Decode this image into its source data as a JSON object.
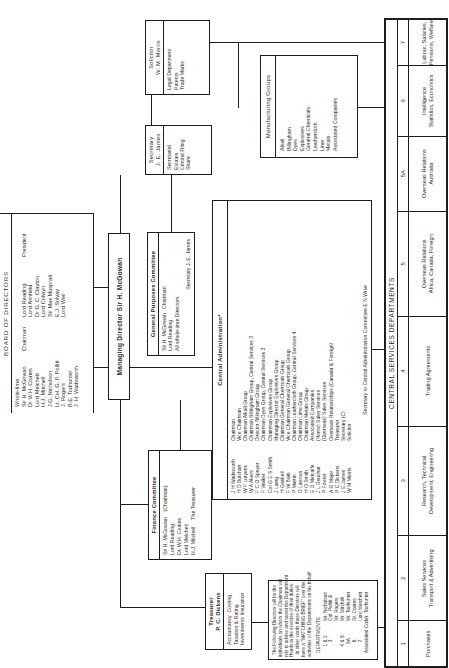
{
  "board": {
    "title": "BOARD OF DIRECTORS",
    "wholetime_label": "Whole-time",
    "wholetime": [
      {
        "name": "Sir H. McGowan",
        "role": "Chairman"
      },
      {
        "name": "Dr W.H. Coates",
        "role": ""
      },
      {
        "name": "Lord Melchett",
        "role": ""
      },
      {
        "name": "H.J. Mitchell",
        "role": ""
      },
      {
        "name": "J.G. Nicholson",
        "role": ""
      },
      {
        "name": "Lt. Col. G. P. Pollitt",
        "role": ""
      },
      {
        "name": "J. Rogers",
        "role": ""
      },
      {
        "name": "B.E. Todhunter",
        "role": ""
      },
      {
        "name": "J. H. Wadsworth",
        "role": ""
      }
    ],
    "others": [
      {
        "name": "Lord Reading",
        "role": "President"
      },
      {
        "name": "Lord Ashfield",
        "role": ""
      },
      {
        "name": "Dr G. C. Clayton",
        "role": ""
      },
      {
        "name": "Lord Colwyn",
        "role": ""
      },
      {
        "name": "Sir Max Muspratt",
        "role": ""
      },
      {
        "name": "E.J. Solvay",
        "role": ""
      },
      {
        "name": "Lord Weir",
        "role": ""
      }
    ],
    "wholetime_text": "Sir H. McGowan\nDr W.H. Coates\nLord Melchett\nH.J. Mitchell\nJ.G. Nicholson\nLt. Col. G. P. Pollitt\nJ. Rogers\nB.E. Todhunter\nJ. H. Wadsworth",
    "wholetime_roles": "Chairman",
    "others_text": "Lord Reading\nLord Ashfield\nDr G. C. Clayton\nLord Colwyn\nSir Max Muspratt\nE.J. Solvay\nLord Weir",
    "others_roles": "President"
  },
  "managing_director": {
    "title": "Managing Director Sir H. McGowan"
  },
  "general_purposes": {
    "title": "General Purposes Committee",
    "members_text": "Sir H. McGowan   Chairman\nLord Reading\nAll whole-time Directors",
    "secretary": "Secretary  J. E. James"
  },
  "finance_committee": {
    "title": "Finance Committee",
    "members_text": "Sir H. McGowan    (Chairman)\nLord Reading\nDr. W.H. Coates\nLord Melchett\nH.J. Mitchell     The Treasurer"
  },
  "treasurer": {
    "title_line1": "Treasurer",
    "title_line2": "P. C. Dickens",
    "duties_text": "Accountancy  Costing\nTaxation & Rating\nInvestments Insurance"
  },
  "secretary": {
    "title_line1": "Secretary",
    "title_line2": "J. E. James",
    "duties_text": "Secretarial\nEstates\nCentral Filing\nShare"
  },
  "solicitor": {
    "title_line1": "Solicitor",
    "title_line2": "W. M. Morris",
    "duties_text": "Legal Department\nPatents\nTrade Marks"
  },
  "manufacturing_groups": {
    "title": "Manufacturing Groups",
    "groups_text": "Alkali\nBillingham\nDyes\nExplosives\nGeneral Chemicals\nLeathercloth\nLime\nMetals\nAssociated Companies"
  },
  "central_admin": {
    "title": "Central Administration*",
    "names_text": "J H Wadsworth\nH D Butchart\nW F Lutyens\nW A Akers\nF C O Speyer\nF Walker\nCol G E S Smith\nJ Laing\nH Gaskell\nF W Bain\nP Martin\nD Lawson\nH O Smith\nE D Metcalfe\nJ L Deuchar\nP Fowler\nA G Major\nP C Dickens\nJ E James\nW M Morris",
    "roles_text": "Chairman\nVice Chairman\nChairman Alkali Group\nChairman Billingham Group, Central Services 3\nDirector Billingham Group\nChairman Dyes Group, Central Services 3\nChairman Explosives Group\nManaging Director Explosives Group\nChairman General Chemicals Group\nVice Chairman General Chemicals Group\nChairman Leathercloth Group, Central Services 4\nChairman Lime Group\nChairman Metals Group\nAssociated Companies\n(Home) Sales Services\n(Overseas) Sales Services\nOverseas Relationships (Canada & Foreign)\nTreasurer\nSecretary (C)\nSolicitor",
    "footer": "Secretary to Central Administration Committee   E N Wise"
  },
  "watching_brief": {
    "note_text": "The Following Directors will be the\nindividuals on whom the Chairman will\nrely to advise and assist the Department\nHeads in the exercise of their duties.\nIn other words these Directors will\nhave a \"WATCHING BRIEF\" over the\nactivities of the Departments on his behalf",
    "departments_label": "DEPARTMENTS",
    "dept_numbers_text": "1 & 2\n3\n\n4 & 5\n5A\n6\n7\nAssociated Cos.",
    "directors_text": "Mr. Nicholson\nCol. Pollitt &\nMr. Rogers\nMr. Mitchell\nMr. Todhunter\nDr. Coates\nLord Melchett\nMr. Todhunter"
  },
  "central_services": {
    "title": "CENTRAL SERVICES DEPARTMENTS",
    "departments": [
      {
        "num": "1",
        "label": "Purchases"
      },
      {
        "num": "2",
        "label": "Sales Services\nTransport & Advertising"
      },
      {
        "num": "3",
        "label": "Research, Technical\nDevelopment, Engineering"
      },
      {
        "num": "4",
        "label": "Trading Agreements"
      },
      {
        "num": "5",
        "label": "Overseas Relations\nAfrica, Canada, Foreign"
      },
      {
        "num": "5A",
        "label": "Overseas Relations\nAustralia"
      },
      {
        "num": "6",
        "label": "Intelligence\nStatistics, Economics"
      },
      {
        "num": "7",
        "label": "Labour, Salaries,\nPensions, Welfare"
      }
    ]
  }
}
